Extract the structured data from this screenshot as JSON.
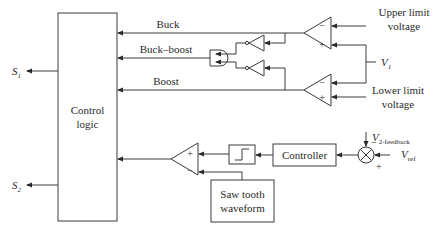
{
  "diagram": {
    "control_block": {
      "line1": "Control",
      "line2": "logic"
    },
    "outputs": {
      "s1": {
        "main": "S",
        "sub": "1"
      },
      "s2": {
        "main": "S",
        "sub": "2"
      }
    },
    "signals": {
      "buck": "Buck",
      "buck_boost": "Buck–boost",
      "boost": "Boost"
    },
    "upper_limit": {
      "line1": "Upper limit",
      "line2": "voltage"
    },
    "lower_limit": {
      "line1": "Lower limit",
      "line2": "voltage"
    },
    "v1": {
      "main": "V",
      "sub": "1"
    },
    "controller": "Controller",
    "sawtooth": {
      "line1": "Saw tooth",
      "line2": "waveform"
    },
    "feedback": {
      "main": "V",
      "sub": "2-feedback"
    },
    "vref": {
      "main": "V",
      "sub": "ref"
    },
    "signs": {
      "plus": "+",
      "minus": "−"
    }
  }
}
